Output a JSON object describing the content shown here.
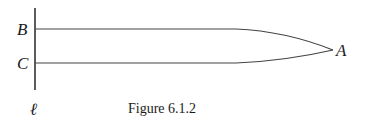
{
  "figure": {
    "caption": "Figure 6.1.2",
    "labels": {
      "B": "B",
      "C": "C",
      "A": "A",
      "line": "ℓ"
    },
    "colors": {
      "stroke": "#333333",
      "text": "#1a1a1a"
    }
  }
}
